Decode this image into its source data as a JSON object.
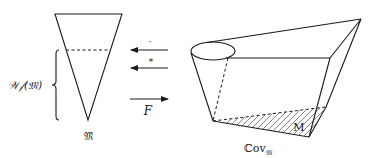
{
  "diagram": {
    "left_figure": {
      "name": "inverted cone (cross-section)",
      "bottom_label": "𝔐",
      "brace_label": "𝒲𝒻(𝔐)"
    },
    "arrows": [
      {
        "direction": "left",
        "label": "·"
      },
      {
        "direction": "left",
        "label": "*"
      },
      {
        "direction": "right",
        "label": "F"
      }
    ],
    "right_figure": {
      "name": "cone over M",
      "inner_label": "M",
      "bottom_label": "ℂov",
      "bottom_label_subscript": "𝔐"
    },
    "colors": {
      "line": "#1a1a1a",
      "background": "#ffffff"
    }
  }
}
